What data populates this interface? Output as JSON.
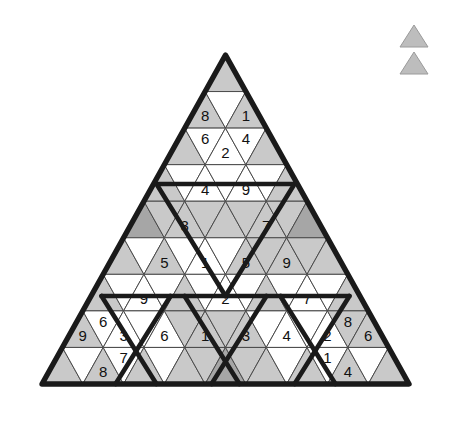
{
  "puzzle": {
    "title": "Triangular Sudoku Grid",
    "shape": "equilateral-triangle",
    "rows": 9,
    "colors": {
      "white": "#ffffff",
      "light_gray": "#c9c9c9",
      "dark_gray": "#a6a6a6",
      "grid_line": "#4a4a4a",
      "region_line": "#1a1a1a",
      "digit": "#111111"
    },
    "cells": [
      {
        "row": 1,
        "index": 0,
        "dir": "up",
        "shade": "light",
        "value": ""
      },
      {
        "row": 2,
        "index": 0,
        "dir": "up",
        "shade": "light",
        "value": "8"
      },
      {
        "row": 2,
        "index": 1,
        "dir": "down",
        "shade": "white",
        "value": ""
      },
      {
        "row": 2,
        "index": 2,
        "dir": "up",
        "shade": "light",
        "value": "1"
      },
      {
        "row": 3,
        "index": 0,
        "dir": "up",
        "shade": "light",
        "value": ""
      },
      {
        "row": 3,
        "index": 1,
        "dir": "down",
        "shade": "white",
        "value": "6"
      },
      {
        "row": 3,
        "index": 2,
        "dir": "up",
        "shade": "white",
        "value": "2"
      },
      {
        "row": 3,
        "index": 3,
        "dir": "down",
        "shade": "white",
        "value": "4"
      },
      {
        "row": 3,
        "index": 4,
        "dir": "up",
        "shade": "light",
        "value": ""
      },
      {
        "row": 4,
        "index": 0,
        "dir": "up",
        "shade": "light",
        "value": ""
      },
      {
        "row": 4,
        "index": 1,
        "dir": "down",
        "shade": "white",
        "value": ""
      },
      {
        "row": 4,
        "index": 2,
        "dir": "up",
        "shade": "white",
        "value": "4"
      },
      {
        "row": 4,
        "index": 3,
        "dir": "down",
        "shade": "white",
        "value": ""
      },
      {
        "row": 4,
        "index": 4,
        "dir": "up",
        "shade": "white",
        "value": "9"
      },
      {
        "row": 4,
        "index": 5,
        "dir": "down",
        "shade": "white",
        "value": ""
      },
      {
        "row": 4,
        "index": 6,
        "dir": "up",
        "shade": "light",
        "value": ""
      },
      {
        "row": 5,
        "index": 0,
        "dir": "up",
        "shade": "dark",
        "value": ""
      },
      {
        "row": 5,
        "index": 1,
        "dir": "down",
        "shade": "light",
        "value": ""
      },
      {
        "row": 5,
        "index": 2,
        "dir": "up",
        "shade": "light",
        "value": "3"
      },
      {
        "row": 5,
        "index": 3,
        "dir": "down",
        "shade": "light",
        "value": ""
      },
      {
        "row": 5,
        "index": 4,
        "dir": "up",
        "shade": "light",
        "value": ""
      },
      {
        "row": 5,
        "index": 5,
        "dir": "down",
        "shade": "light",
        "value": ""
      },
      {
        "row": 5,
        "index": 6,
        "dir": "up",
        "shade": "light",
        "value": "7"
      },
      {
        "row": 5,
        "index": 7,
        "dir": "down",
        "shade": "light",
        "value": ""
      },
      {
        "row": 5,
        "index": 8,
        "dir": "up",
        "shade": "dark",
        "value": ""
      },
      {
        "row": 6,
        "index": 0,
        "dir": "up",
        "shade": "light",
        "value": ""
      },
      {
        "row": 6,
        "index": 1,
        "dir": "down",
        "shade": "white",
        "value": ""
      },
      {
        "row": 6,
        "index": 2,
        "dir": "up",
        "shade": "light",
        "value": "5"
      },
      {
        "row": 6,
        "index": 3,
        "dir": "down",
        "shade": "white",
        "value": ""
      },
      {
        "row": 6,
        "index": 4,
        "dir": "up",
        "shade": "white",
        "value": "1"
      },
      {
        "row": 6,
        "index": 5,
        "dir": "down",
        "shade": "white",
        "value": ""
      },
      {
        "row": 6,
        "index": 6,
        "dir": "up",
        "shade": "light",
        "value": "5"
      },
      {
        "row": 6,
        "index": 7,
        "dir": "down",
        "shade": "light",
        "value": ""
      },
      {
        "row": 6,
        "index": 8,
        "dir": "up",
        "shade": "light",
        "value": "9"
      },
      {
        "row": 6,
        "index": 9,
        "dir": "down",
        "shade": "light",
        "value": ""
      },
      {
        "row": 6,
        "index": 10,
        "dir": "up",
        "shade": "light",
        "value": ""
      },
      {
        "row": 7,
        "index": 0,
        "dir": "up",
        "shade": "light",
        "value": ""
      },
      {
        "row": 7,
        "index": 1,
        "dir": "down",
        "shade": "white",
        "value": ""
      },
      {
        "row": 7,
        "index": 2,
        "dir": "up",
        "shade": "white",
        "value": "9"
      },
      {
        "row": 7,
        "index": 3,
        "dir": "down",
        "shade": "white",
        "value": ""
      },
      {
        "row": 7,
        "index": 4,
        "dir": "up",
        "shade": "light",
        "value": ""
      },
      {
        "row": 7,
        "index": 5,
        "dir": "down",
        "shade": "white",
        "value": ""
      },
      {
        "row": 7,
        "index": 6,
        "dir": "up",
        "shade": "white",
        "value": "2"
      },
      {
        "row": 7,
        "index": 7,
        "dir": "down",
        "shade": "white",
        "value": ""
      },
      {
        "row": 7,
        "index": 8,
        "dir": "up",
        "shade": "light",
        "value": ""
      },
      {
        "row": 7,
        "index": 9,
        "dir": "down",
        "shade": "white",
        "value": ""
      },
      {
        "row": 7,
        "index": 10,
        "dir": "up",
        "shade": "white",
        "value": "7"
      },
      {
        "row": 7,
        "index": 11,
        "dir": "down",
        "shade": "white",
        "value": ""
      },
      {
        "row": 7,
        "index": 12,
        "dir": "up",
        "shade": "light",
        "value": ""
      },
      {
        "row": 8,
        "index": 0,
        "dir": "up",
        "shade": "light",
        "value": "9"
      },
      {
        "row": 8,
        "index": 1,
        "dir": "down",
        "shade": "white",
        "value": "6"
      },
      {
        "row": 8,
        "index": 2,
        "dir": "up",
        "shade": "white",
        "value": "3"
      },
      {
        "row": 8,
        "index": 3,
        "dir": "down",
        "shade": "white",
        "value": ""
      },
      {
        "row": 8,
        "index": 4,
        "dir": "up",
        "shade": "white",
        "value": "6"
      },
      {
        "row": 8,
        "index": 5,
        "dir": "down",
        "shade": "light",
        "value": ""
      },
      {
        "row": 8,
        "index": 6,
        "dir": "up",
        "shade": "light",
        "value": "1"
      },
      {
        "row": 8,
        "index": 7,
        "dir": "down",
        "shade": "light",
        "value": ""
      },
      {
        "row": 8,
        "index": 8,
        "dir": "up",
        "shade": "light",
        "value": "3"
      },
      {
        "row": 8,
        "index": 9,
        "dir": "down",
        "shade": "white",
        "value": ""
      },
      {
        "row": 8,
        "index": 10,
        "dir": "up",
        "shade": "white",
        "value": "4"
      },
      {
        "row": 8,
        "index": 11,
        "dir": "down",
        "shade": "white",
        "value": ""
      },
      {
        "row": 8,
        "index": 12,
        "dir": "up",
        "shade": "white",
        "value": "2"
      },
      {
        "row": 8,
        "index": 13,
        "dir": "down",
        "shade": "light",
        "value": "8"
      },
      {
        "row": 8,
        "index": 14,
        "dir": "up",
        "shade": "light",
        "value": "6"
      },
      {
        "row": 9,
        "index": 0,
        "dir": "up",
        "shade": "light",
        "value": ""
      },
      {
        "row": 9,
        "index": 1,
        "dir": "down",
        "shade": "white",
        "value": ""
      },
      {
        "row": 9,
        "index": 2,
        "dir": "up",
        "shade": "light",
        "value": "8"
      },
      {
        "row": 9,
        "index": 3,
        "dir": "down",
        "shade": "white",
        "value": "7"
      },
      {
        "row": 9,
        "index": 4,
        "dir": "up",
        "shade": "light",
        "value": ""
      },
      {
        "row": 9,
        "index": 5,
        "dir": "down",
        "shade": "white",
        "value": ""
      },
      {
        "row": 9,
        "index": 6,
        "dir": "up",
        "shade": "light",
        "value": ""
      },
      {
        "row": 9,
        "index": 7,
        "dir": "down",
        "shade": "light",
        "value": ""
      },
      {
        "row": 9,
        "index": 8,
        "dir": "up",
        "shade": "dark",
        "value": ""
      },
      {
        "row": 9,
        "index": 9,
        "dir": "down",
        "shade": "light",
        "value": ""
      },
      {
        "row": 9,
        "index": 10,
        "dir": "up",
        "shade": "light",
        "value": ""
      },
      {
        "row": 9,
        "index": 11,
        "dir": "down",
        "shade": "white",
        "value": ""
      },
      {
        "row": 9,
        "index": 12,
        "dir": "up",
        "shade": "light",
        "value": ""
      },
      {
        "row": 9,
        "index": 13,
        "dir": "down",
        "shade": "white",
        "value": "1"
      },
      {
        "row": 9,
        "index": 14,
        "dir": "up",
        "shade": "light",
        "value": "4"
      },
      {
        "row": 9,
        "index": 15,
        "dir": "down",
        "shade": "white",
        "value": ""
      },
      {
        "row": 9,
        "index": 16,
        "dir": "up",
        "shade": "light",
        "value": ""
      }
    ]
  },
  "legend": {
    "items": [
      {
        "name": "legend-triangle-upper",
        "shade": "light"
      },
      {
        "name": "legend-triangle-lower",
        "shade": "light"
      }
    ]
  }
}
